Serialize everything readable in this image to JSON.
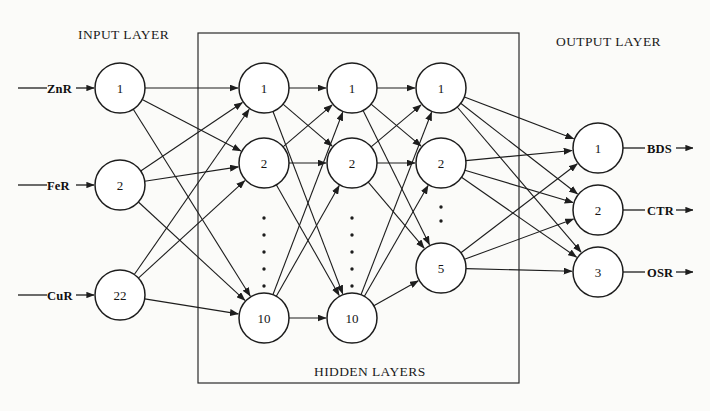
{
  "diagram": {
    "title_labels": {
      "input_layer": "INPUT LAYER",
      "output_layer": "OUTPUT LAYER",
      "hidden_layers": "HIDDEN LAYERS"
    },
    "inputs": [
      {
        "label": "ZnR",
        "node": "1"
      },
      {
        "label": "FeR",
        "node": "2"
      },
      {
        "label": "CuR",
        "node": "22"
      }
    ],
    "outputs": [
      {
        "label": "BDS",
        "node": "1"
      },
      {
        "label": "CTR",
        "node": "2"
      },
      {
        "label": "OSR",
        "node": "3"
      }
    ],
    "layers": [
      {
        "name": "input-layer",
        "kind": "input",
        "node_count_text": "22",
        "nodes": [
          {
            "text": "1"
          },
          {
            "text": "2"
          },
          {
            "text": "22"
          }
        ],
        "has_ellipsis": false
      },
      {
        "name": "hidden-layer-1",
        "kind": "hidden",
        "node_count_text": "10",
        "nodes": [
          {
            "text": "1"
          },
          {
            "text": "2"
          },
          {
            "text": "10"
          }
        ],
        "has_ellipsis": true,
        "ellipsis_dots": 5
      },
      {
        "name": "hidden-layer-2",
        "kind": "hidden",
        "node_count_text": "10",
        "nodes": [
          {
            "text": "1"
          },
          {
            "text": "2"
          },
          {
            "text": "10"
          }
        ],
        "has_ellipsis": true,
        "ellipsis_dots": 5
      },
      {
        "name": "hidden-layer-3",
        "kind": "hidden",
        "node_count_text": "5",
        "nodes": [
          {
            "text": "1"
          },
          {
            "text": "2"
          },
          {
            "text": "5"
          }
        ],
        "has_ellipsis": true,
        "ellipsis_dots": 2
      },
      {
        "name": "output-layer",
        "kind": "output",
        "node_count_text": "3",
        "nodes": [
          {
            "text": "1"
          },
          {
            "text": "2"
          },
          {
            "text": "3"
          }
        ],
        "has_ellipsis": false
      }
    ],
    "colors": {
      "stroke": "#1d1d1d",
      "node_fill": "#ffffff",
      "background": "#fbfbf9",
      "text": "#141414"
    }
  }
}
